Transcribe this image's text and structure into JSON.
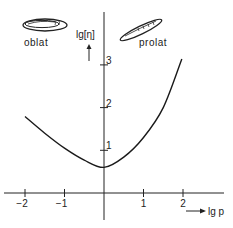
{
  "chart_data": {
    "type": "line",
    "title": "",
    "xlabel": "lg p",
    "ylabel": "lg[η]",
    "xlim": [
      -2.4,
      3.0
    ],
    "ylim": [
      -0.8,
      3.6
    ],
    "xticks": [
      -2,
      -1,
      1,
      2
    ],
    "xtick_labels": [
      "−2",
      "−1",
      "1",
      "2"
    ],
    "yticks": [
      1,
      2,
      3
    ],
    "ytick_labels": [
      "1",
      "2",
      "3"
    ],
    "grid": false,
    "legend": "none",
    "series": [
      {
        "name": "lg[η] vs lg p",
        "x": [
          -2.0,
          -1.5,
          -1.0,
          -0.5,
          0.0,
          0.5,
          1.0,
          1.5,
          1.97
        ],
        "y": [
          1.79,
          1.4,
          1.05,
          0.77,
          0.6,
          0.84,
          1.3,
          2.0,
          3.14
        ]
      }
    ],
    "annotations": [
      {
        "text": "oblat",
        "shape": "oblate-ellipsoid",
        "position": "top-left"
      },
      {
        "text": "prolat",
        "shape": "prolate-ellipsoid",
        "position": "top-right"
      }
    ]
  }
}
